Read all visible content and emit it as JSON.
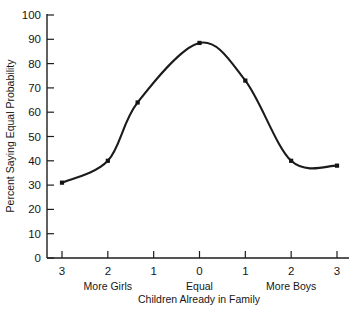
{
  "chart_data": {
    "type": "line",
    "title": "",
    "xlabel": "Children Already in Family",
    "ylabel": "Percent Saying Equal Probability",
    "x": [
      -3,
      -2,
      -1.35,
      0,
      1,
      2,
      3
    ],
    "values": [
      31,
      40,
      64,
      88.5,
      73,
      40,
      38
    ],
    "x_tick_positions": [
      -3,
      -2,
      -1,
      0,
      1,
      2,
      3
    ],
    "x_tick_labels": [
      "3",
      "2",
      "1",
      "0",
      "1",
      "2",
      "3"
    ],
    "y_tick_values": [
      0,
      10,
      20,
      30,
      40,
      50,
      60,
      70,
      80,
      90,
      100
    ],
    "y_tick_labels": [
      "0",
      "10",
      "20",
      "30",
      "40",
      "50",
      "60",
      "70",
      "80",
      "90",
      "100"
    ],
    "xlim": [
      -3.25,
      3.25
    ],
    "ylim": [
      0,
      100
    ],
    "grid": false,
    "legend": null,
    "group_labels": [
      {
        "text": "More Girls",
        "x": -2
      },
      {
        "text": "Equal",
        "x": 0
      },
      {
        "text": "More Boys",
        "x": 2
      }
    ],
    "series": [
      {
        "name": "Percent Saying Equal Probability",
        "points": [
          {
            "x": -3,
            "y": 31
          },
          {
            "x": -2,
            "y": 40
          },
          {
            "x": -1.35,
            "y": 64
          },
          {
            "x": 0,
            "y": 88.5
          },
          {
            "x": 1,
            "y": 73
          },
          {
            "x": 2,
            "y": 40
          },
          {
            "x": 3,
            "y": 38
          }
        ]
      }
    ],
    "marker_style": "filled-square",
    "line_color": "#1b1b1b"
  },
  "labels": {
    "y_axis_title": "Percent Saying Equal Probability",
    "x_axis_title": "Children Already in Family",
    "more_girls": "More Girls",
    "equal": "Equal",
    "more_boys": "More Boys"
  }
}
